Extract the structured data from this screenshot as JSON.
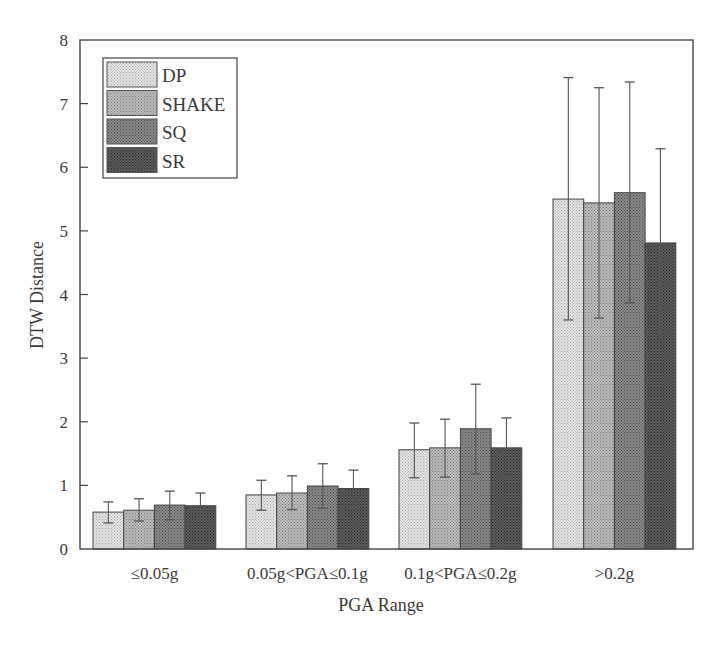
{
  "chart_data": {
    "type": "bar",
    "title": "",
    "xlabel": "PGA Range",
    "ylabel": "DTW Distance",
    "ylim": [
      0,
      8
    ],
    "yticks": [
      0,
      1,
      2,
      3,
      4,
      5,
      6,
      7,
      8
    ],
    "grid": false,
    "legend_position": "upper left",
    "categories": [
      "≤0.05g",
      "0.05g<PGA≤0.1g",
      "0.1g<PGA≤0.2g",
      ">0.2g"
    ],
    "series": [
      {
        "name": "DP",
        "color": "#e4e4e4",
        "dot": "#a8a8a8",
        "values": [
          0.58,
          0.85,
          1.56,
          5.5
        ],
        "error_low": [
          0.41,
          0.61,
          1.12,
          3.6
        ],
        "error_high": [
          0.74,
          1.08,
          1.98,
          7.41
        ]
      },
      {
        "name": "SHAKE",
        "color": "#bdbdbd",
        "dot": "#7a7a7a",
        "values": [
          0.61,
          0.88,
          1.59,
          5.44
        ],
        "error_low": [
          0.44,
          0.62,
          1.13,
          3.63
        ],
        "error_high": [
          0.79,
          1.15,
          2.04,
          7.25
        ]
      },
      {
        "name": "SQ",
        "color": "#8a8a8a",
        "dot": "#4a4a4a",
        "values": [
          0.69,
          0.99,
          1.89,
          5.6
        ],
        "error_low": [
          0.46,
          0.64,
          1.18,
          3.87
        ],
        "error_high": [
          0.91,
          1.34,
          2.59,
          7.34
        ]
      },
      {
        "name": "SR",
        "color": "#5c5c5c",
        "dot": "#2a2a2a",
        "values": [
          0.68,
          0.95,
          1.59,
          4.81
        ],
        "error_low": [
          0.46,
          0.66,
          1.13,
          3.32
        ],
        "error_high": [
          0.88,
          1.24,
          2.06,
          6.29
        ]
      }
    ]
  },
  "axes": {
    "x_title": "PGA Range",
    "y_title": "DTW Distance"
  },
  "legend": {
    "items": [
      "DP",
      "SHAKE",
      "SQ",
      "SR"
    ]
  }
}
